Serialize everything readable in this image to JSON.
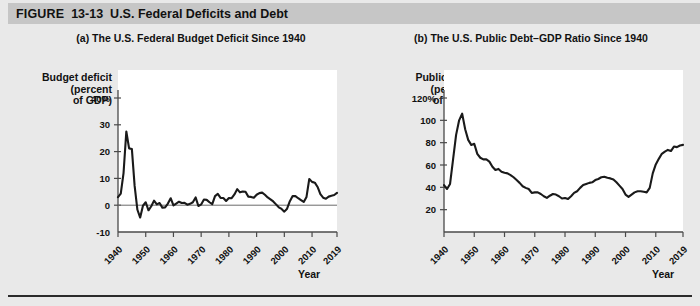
{
  "header": {
    "figure_label": "FIGURE",
    "figure_number": "13-13",
    "title": "U.S. Federal Deficits and Debt"
  },
  "panel_a": {
    "title": "(a) The U.S. Federal Budget Deficit Since 1940",
    "y_axis_title_line1": "Budget deficit",
    "y_axis_title_line2": "(percent",
    "y_axis_title_line3": "of GDP)",
    "x_axis_title": "Year"
  },
  "panel_b": {
    "title": "(b) The U.S. Public Debt–GDP Ratio Since 1940",
    "y_axis_title_line1": "Public debt",
    "y_axis_title_line2": "(percent",
    "y_axis_title_line3": "of GDP)",
    "x_axis_title": "Year"
  },
  "colors": {
    "header_bar": "#c6c6c6",
    "page_background": "#e9e9e9",
    "plot_background": "#ffffff",
    "line": "#1a1a1a",
    "axis": "#4a4a4a",
    "zero_line": "#6b6b6b"
  },
  "chart_data": [
    {
      "type": "line",
      "id": "panel-a",
      "title": "(a) The U.S. Federal Budget Deficit Since 1940",
      "xlabel": "Year",
      "ylabel": "Budget deficit (percent of GDP)",
      "xlim": [
        1940,
        2019
      ],
      "ylim": [
        -10,
        40
      ],
      "ytick_values": [
        -10,
        0,
        10,
        20,
        30,
        40
      ],
      "ytick_labels": [
        "-10",
        "0",
        "10",
        "20",
        "30",
        "40%"
      ],
      "xtick_values": [
        1940,
        1950,
        1960,
        1970,
        1980,
        1990,
        2000,
        2010,
        2019
      ],
      "xtick_labels": [
        "1940",
        "1950",
        "1960",
        "1970",
        "1980",
        "1990",
        "2000",
        "2010",
        "2019"
      ],
      "grid": false,
      "legend": "none",
      "zero_line": 0,
      "x": [
        1940,
        1941,
        1942,
        1943,
        1944,
        1945,
        1946,
        1947,
        1948,
        1949,
        1950,
        1951,
        1952,
        1953,
        1954,
        1955,
        1956,
        1957,
        1958,
        1959,
        1960,
        1961,
        1962,
        1963,
        1964,
        1965,
        1966,
        1967,
        1968,
        1969,
        1970,
        1971,
        1972,
        1973,
        1974,
        1975,
        1976,
        1977,
        1978,
        1979,
        1980,
        1981,
        1982,
        1983,
        1984,
        1985,
        1986,
        1987,
        1988,
        1989,
        1990,
        1991,
        1992,
        1993,
        1994,
        1995,
        1996,
        1997,
        1998,
        1999,
        2000,
        2001,
        2002,
        2003,
        2004,
        2005,
        2006,
        2007,
        2008,
        2009,
        2010,
        2011,
        2012,
        2013,
        2014,
        2015,
        2016,
        2017,
        2018,
        2019
      ],
      "values": [
        3.0,
        4.3,
        12.0,
        27.5,
        21.2,
        21.0,
        7.2,
        -1.7,
        -4.6,
        -0.2,
        1.1,
        -1.9,
        -0.4,
        1.7,
        0.3,
        0.8,
        -0.9,
        -0.8,
        0.6,
        2.6,
        -0.1,
        0.6,
        1.3,
        0.8,
        0.9,
        0.2,
        0.5,
        1.1,
        2.9,
        -0.3,
        0.3,
        2.1,
        2.0,
        1.1,
        0.4,
        3.4,
        4.2,
        2.7,
        2.7,
        1.6,
        2.7,
        2.6,
        4.0,
        6.0,
        4.8,
        5.1,
        5.0,
        3.2,
        3.1,
        2.8,
        3.9,
        4.5,
        4.7,
        3.9,
        2.9,
        2.2,
        1.4,
        0.3,
        -0.8,
        -1.4,
        -2.4,
        -1.3,
        1.5,
        3.4,
        3.4,
        2.6,
        1.9,
        1.2,
        3.1,
        9.8,
        8.7,
        8.4,
        6.8,
        4.1,
        2.8,
        2.4,
        3.2,
        3.5,
        3.8,
        4.6
      ],
      "annotations": [
        "WWII deficit spike peaks near 27% of GDP in 1943",
        "Budget surpluses (negative deficits) in 1998-2001",
        "Great Recession deficit spike near 10% of GDP in 2009"
      ]
    },
    {
      "type": "line",
      "id": "panel-b",
      "title": "(b) The U.S. Public Debt–GDP Ratio Since 1940",
      "xlabel": "Year",
      "ylabel": "Public debt (percent of GDP)",
      "xlim": [
        1940,
        2019
      ],
      "ylim": [
        0,
        120
      ],
      "ytick_values": [
        20,
        40,
        60,
        80,
        100,
        120
      ],
      "ytick_labels": [
        "20",
        "40",
        "60",
        "80",
        "100",
        "120%"
      ],
      "xtick_values": [
        1940,
        1950,
        1960,
        1970,
        1980,
        1990,
        2000,
        2010,
        2019
      ],
      "xtick_labels": [
        "1940",
        "1950",
        "1960",
        "1970",
        "1980",
        "1990",
        "2000",
        "2010",
        "2019"
      ],
      "grid": false,
      "legend": "none",
      "x": [
        1940,
        1941,
        1942,
        1943,
        1944,
        1945,
        1946,
        1947,
        1948,
        1949,
        1950,
        1951,
        1952,
        1953,
        1954,
        1955,
        1956,
        1957,
        1958,
        1959,
        1960,
        1961,
        1962,
        1963,
        1964,
        1965,
        1966,
        1967,
        1968,
        1969,
        1970,
        1971,
        1972,
        1973,
        1974,
        1975,
        1976,
        1977,
        1978,
        1979,
        1980,
        1981,
        1982,
        1983,
        1984,
        1985,
        1986,
        1987,
        1988,
        1989,
        1990,
        1991,
        1992,
        1993,
        1994,
        1995,
        1996,
        1997,
        1998,
        1999,
        2000,
        2001,
        2002,
        2003,
        2004,
        2005,
        2006,
        2007,
        2008,
        2009,
        2010,
        2011,
        2012,
        2013,
        2014,
        2015,
        2016,
        2017,
        2018,
        2019
      ],
      "values": [
        42.0,
        38.5,
        43.0,
        65.0,
        87.0,
        100.0,
        106.0,
        92.0,
        82.5,
        78.0,
        79.0,
        70.0,
        66.5,
        65.0,
        65.0,
        63.0,
        58.5,
        55.5,
        56.5,
        54.0,
        53.0,
        52.5,
        51.0,
        49.0,
        46.5,
        44.0,
        41.0,
        39.5,
        38.5,
        35.0,
        35.5,
        35.5,
        34.0,
        32.0,
        30.5,
        32.5,
        34.0,
        33.5,
        32.0,
        30.0,
        30.5,
        29.5,
        32.0,
        35.0,
        36.5,
        39.5,
        42.0,
        43.0,
        44.0,
        44.5,
        46.5,
        47.5,
        49.0,
        49.5,
        48.5,
        48.0,
        47.0,
        44.5,
        41.5,
        38.5,
        33.5,
        31.5,
        33.5,
        35.5,
        36.5,
        36.5,
        36.0,
        35.5,
        39.5,
        52.5,
        60.5,
        65.5,
        70.0,
        72.0,
        73.5,
        72.5,
        76.5,
        76.0,
        77.5,
        78.0
      ],
      "annotations": [
        "Debt-GDP ratio peaks near 106% just after WWII in 1946",
        "Trough near 24-30% in the early 1970s",
        "Rises steeply after 2008 to about 78% by 2019"
      ]
    }
  ]
}
